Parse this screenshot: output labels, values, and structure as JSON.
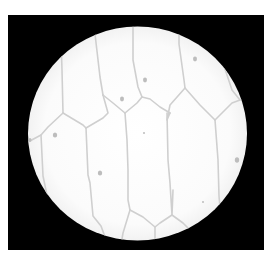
{
  "figure": {
    "background_color": "#000000",
    "field_color": "#fdfdfd",
    "wall_color": "#cfcfcf",
    "nucleus_color": "#bdbdbd"
  }
}
